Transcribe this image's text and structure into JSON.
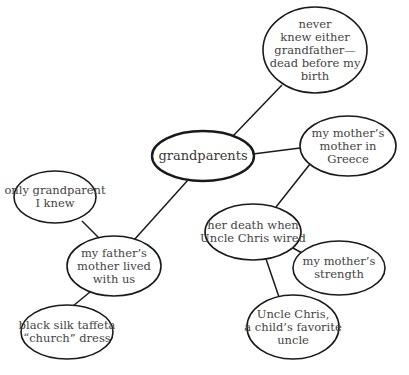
{
  "diagram": {
    "type": "cluster-map",
    "central": {
      "id": "grandparents",
      "lines": [
        "grandparents"
      ],
      "cx": 203,
      "cy": 156,
      "rx": 51,
      "ry": 25,
      "stroke": 2.4
    },
    "nodes": [
      {
        "id": "never-knew",
        "lines": [
          "never",
          "knew either",
          "grandfather—",
          "dead before my",
          "birth"
        ],
        "cx": 315,
        "cy": 50,
        "rx": 52,
        "ry": 43
      },
      {
        "id": "mothers-mother",
        "lines": [
          "my mother’s",
          "mother in",
          "Greece"
        ],
        "cx": 348,
        "cy": 146,
        "rx": 48,
        "ry": 30
      },
      {
        "id": "only-grandparent",
        "lines": [
          "only grandparent",
          "I knew"
        ],
        "cx": 55,
        "cy": 197,
        "rx": 41,
        "ry": 26
      },
      {
        "id": "her-death",
        "lines": [
          "her death when",
          "Uncle Chris wired"
        ],
        "cx": 253,
        "cy": 232,
        "rx": 48,
        "ry": 28
      },
      {
        "id": "fathers-mother",
        "lines": [
          "my father’s",
          "mother lived",
          "with us"
        ],
        "cx": 114,
        "cy": 266,
        "rx": 47,
        "ry": 30
      },
      {
        "id": "mothers-strength",
        "lines": [
          "my mother’s",
          "strength"
        ],
        "cx": 339,
        "cy": 268,
        "rx": 46,
        "ry": 27
      },
      {
        "id": "black-silk",
        "lines": [
          "black silk taffeta",
          "“church” dress"
        ],
        "cx": 67,
        "cy": 332,
        "rx": 46,
        "ry": 27
      },
      {
        "id": "uncle-chris",
        "lines": [
          "Uncle Chris,",
          "a child’s favorite",
          "uncle"
        ],
        "cx": 293,
        "cy": 327,
        "rx": 46,
        "ry": 32
      }
    ],
    "edges": [
      {
        "from": "grandparents",
        "to": "never-knew",
        "x1": 233,
        "y1": 136,
        "x2": 282,
        "y2": 85
      },
      {
        "from": "grandparents",
        "to": "mothers-mother",
        "x1": 253,
        "y1": 154,
        "x2": 300,
        "y2": 148
      },
      {
        "from": "grandparents",
        "to": "fathers-mother",
        "x1": 188,
        "y1": 180,
        "x2": 134,
        "y2": 240
      },
      {
        "from": "mothers-mother",
        "to": "her-death",
        "x1": 310,
        "y1": 164,
        "x2": 276,
        "y2": 207
      },
      {
        "from": "only-grandparent",
        "to": "fathers-mother",
        "x1": 82,
        "y1": 221,
        "x2": 102,
        "y2": 241
      },
      {
        "from": "her-death",
        "to": "mothers-strength",
        "x1": 291,
        "y1": 247,
        "x2": 304,
        "y2": 254
      },
      {
        "from": "her-death",
        "to": "uncle-chris",
        "x1": 266,
        "y1": 259,
        "x2": 279,
        "y2": 297
      },
      {
        "from": "fathers-mother",
        "to": "black-silk",
        "x1": 90,
        "y1": 292,
        "x2": 73,
        "y2": 306
      }
    ],
    "colors": {
      "stroke": "#1a1a1a",
      "text": "#444444",
      "background": "#ffffff"
    }
  }
}
